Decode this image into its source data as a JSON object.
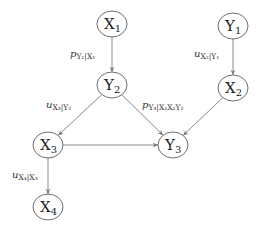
{
  "diagram": {
    "title": "",
    "nodes": [
      {
        "id": "X1",
        "base": "X",
        "sub": "1",
        "cx": 112,
        "cy": 24
      },
      {
        "id": "Y1",
        "base": "Y",
        "sub": "1",
        "cx": 233,
        "cy": 26
      },
      {
        "id": "Y2",
        "base": "Y",
        "sub": "2",
        "cx": 112,
        "cy": 85
      },
      {
        "id": "X2",
        "base": "X",
        "sub": "2",
        "cx": 233,
        "cy": 88
      },
      {
        "id": "X3",
        "base": "X",
        "sub": "3",
        "cx": 48,
        "cy": 145
      },
      {
        "id": "Y3",
        "base": "Y",
        "sub": "3",
        "cx": 173,
        "cy": 145
      },
      {
        "id": "X4",
        "base": "X",
        "sub": "4",
        "cx": 48,
        "cy": 207
      }
    ],
    "edges": [
      {
        "from": "X1",
        "to": "Y2",
        "label_base": "p",
        "label_sub": "Y₂|X₁",
        "lx": 70,
        "ly": 57
      },
      {
        "from": "Y1",
        "to": "X2",
        "label_base": "u",
        "label_sub": "X₂|Y₁",
        "lx": 194,
        "ly": 57
      },
      {
        "from": "Y2",
        "to": "X3",
        "label_base": "u",
        "label_sub": "X₃|Y₂",
        "lx": 46,
        "ly": 108
      },
      {
        "from": "Y2",
        "to": "Y3",
        "label_base": "p",
        "label_sub": "Y₃|X₁X₂Y₂",
        "lx": 142,
        "ly": 108
      },
      {
        "from": "X2",
        "to": "Y3",
        "label_base": "",
        "label_sub": "",
        "lx": 0,
        "ly": 0
      },
      {
        "from": "X3",
        "to": "Y3",
        "label_base": "",
        "label_sub": "",
        "lx": 0,
        "ly": 0
      },
      {
        "from": "X3",
        "to": "X4",
        "label_base": "u",
        "label_sub": "X₄|X₃",
        "lx": 12,
        "ly": 178
      }
    ],
    "colors": {
      "node_stroke": "#6f6f6f",
      "edge_stroke": "#8a8a8a",
      "text": "#222222"
    }
  }
}
